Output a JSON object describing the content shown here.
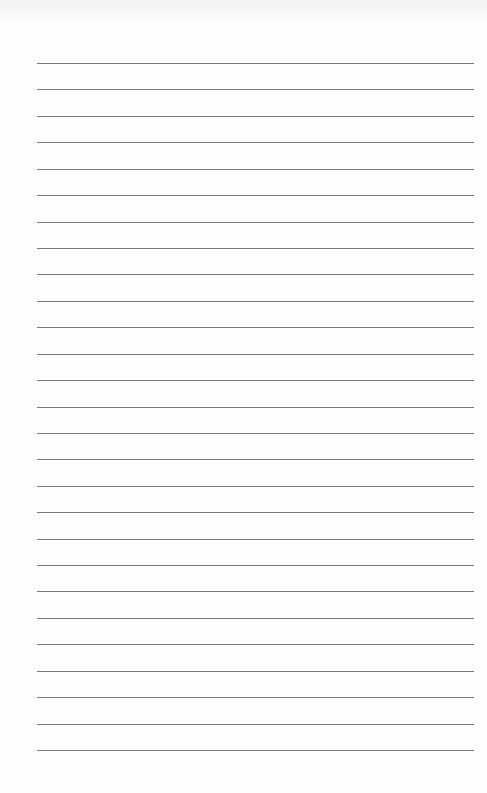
{
  "document": {
    "type": "blank ruled notebook page",
    "line_count": 27,
    "line_color": "#7a7a7a",
    "paper_color": "#fefefe",
    "text": ""
  }
}
